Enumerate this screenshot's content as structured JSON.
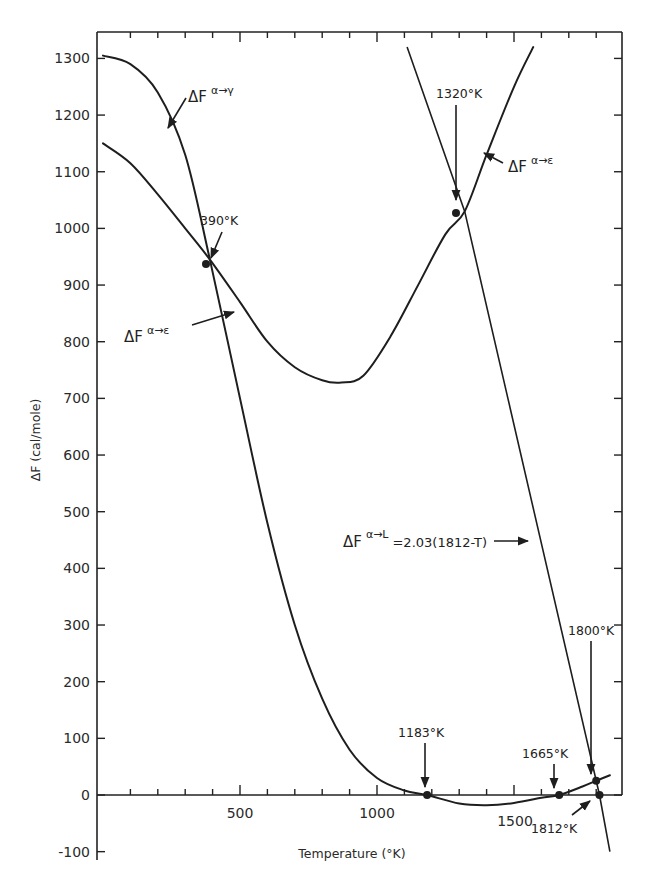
{
  "chart_data": {
    "type": "line",
    "title": "",
    "xlabel": "Temperature (°K)",
    "ylabel": "ΔF (cal/mole)",
    "xlim": [
      0,
      1890
    ],
    "ylim": [
      -100,
      1350
    ],
    "x_ticks": [
      500,
      1000,
      1500
    ],
    "x_minor_step": 100,
    "y_ticks": [
      -100,
      0,
      100,
      200,
      300,
      400,
      500,
      600,
      700,
      800,
      900,
      1000,
      1100,
      1200,
      1300
    ],
    "grid": false,
    "legend": "none (inline curve labels)",
    "series": [
      {
        "name": "ΔF α→γ",
        "label_main": "ΔF",
        "label_sup": "α→γ",
        "points": [
          [
            0,
            1305
          ],
          [
            100,
            1290
          ],
          [
            200,
            1240
          ],
          [
            300,
            1130
          ],
          [
            390,
            945
          ],
          [
            500,
            700
          ],
          [
            600,
            480
          ],
          [
            700,
            300
          ],
          [
            800,
            170
          ],
          [
            900,
            80
          ],
          [
            1000,
            30
          ],
          [
            1100,
            8
          ],
          [
            1183,
            0
          ],
          [
            1300,
            -15
          ],
          [
            1400,
            -18
          ],
          [
            1500,
            -14
          ],
          [
            1600,
            -5
          ],
          [
            1665,
            0
          ],
          [
            1750,
            15
          ],
          [
            1800,
            25
          ],
          [
            1850,
            35
          ]
        ]
      },
      {
        "name": "ΔF α→ε",
        "label_main": "ΔF",
        "label_sup": "α→ε",
        "points": [
          [
            0,
            1150
          ],
          [
            100,
            1115
          ],
          [
            200,
            1060
          ],
          [
            300,
            1000
          ],
          [
            390,
            945
          ],
          [
            500,
            870
          ],
          [
            600,
            800
          ],
          [
            700,
            755
          ],
          [
            800,
            732
          ],
          [
            870,
            728
          ],
          [
            950,
            740
          ],
          [
            1050,
            810
          ],
          [
            1150,
            900
          ],
          [
            1250,
            990
          ],
          [
            1320,
            1030
          ],
          [
            1400,
            1130
          ],
          [
            1500,
            1250
          ],
          [
            1570,
            1320
          ]
        ]
      },
      {
        "name": "ΔF α→L",
        "label_main": "ΔF",
        "label_sup": "α→L",
        "formula": "=2.03(1812-T)",
        "points": [
          [
            1110,
            1320
          ],
          [
            1320,
            1030
          ],
          [
            1812,
            0
          ],
          [
            1850,
            -100
          ]
        ]
      }
    ],
    "annotations": [
      {
        "text": "390°K",
        "x": 390,
        "y": 945,
        "marker": true
      },
      {
        "text": "1320°K",
        "x": 1320,
        "y": 1030,
        "marker": true
      },
      {
        "text": "1183°K",
        "x": 1183,
        "y": 0,
        "marker": true
      },
      {
        "text": "1665°K",
        "x": 1665,
        "y": 0,
        "marker": true
      },
      {
        "text": "1800°K",
        "x": 1800,
        "y": 25,
        "marker": true
      },
      {
        "text": "1812°K",
        "x": 1812,
        "y": 0,
        "marker": true
      }
    ]
  },
  "labels": {
    "xlabel": "Temperature (°K)",
    "ylabel": "ΔF (cal/mole)",
    "x_tick_500": "500",
    "x_tick_1000": "1000",
    "x_tick_1500": "1500",
    "y_ticks": [
      "-100",
      "0",
      "100",
      "200",
      "300",
      "400",
      "500",
      "600",
      "700",
      "800",
      "900",
      "1000",
      "1100",
      "1200",
      "1300"
    ],
    "curve_gamma": {
      "main": "ΔF",
      "sup": "α→γ"
    },
    "curve_eps_top": {
      "main": "ΔF",
      "sup": "α→ε"
    },
    "curve_eps_left": {
      "main": "ΔF",
      "sup": "α→ε"
    },
    "curve_liquid": {
      "main": "ΔF",
      "sup": "α→L",
      "formula": "=2.03(1812-T)"
    },
    "annot_390": "390°K",
    "annot_1320": "1320°K",
    "annot_1183": "1183°K",
    "annot_1665": "1665°K",
    "annot_1800": "1800°K",
    "annot_1812": "1812°K"
  }
}
